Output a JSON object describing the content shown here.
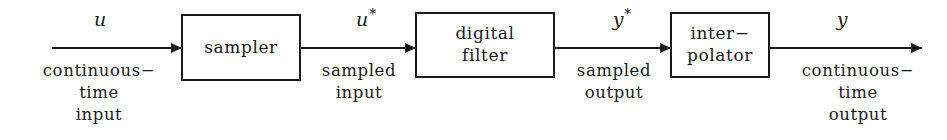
{
  "diagram": {
    "ink_color": "#1a1a1a",
    "background": "#ffffff",
    "blocks": [
      {
        "id": "sampler",
        "label": "sampler"
      },
      {
        "id": "filter",
        "label": "digital\nfilter"
      },
      {
        "id": "interpolator",
        "label": "inter−\npolator"
      }
    ],
    "signals": [
      {
        "id": "u",
        "symbol": "u",
        "starred": false
      },
      {
        "id": "u-star",
        "symbol": "u",
        "starred": true,
        "star": "*"
      },
      {
        "id": "y-star",
        "symbol": "y",
        "starred": true,
        "star": "*"
      },
      {
        "id": "y",
        "symbol": "y",
        "starred": false
      }
    ],
    "captions": [
      {
        "id": "input",
        "text": "continuous−\ntime\ninput"
      },
      {
        "id": "sampled-in",
        "text": "sampled\ninput"
      },
      {
        "id": "sampled-out",
        "text": "sampled\noutput"
      },
      {
        "id": "output",
        "text": "continuous−\ntime\noutput"
      }
    ]
  }
}
